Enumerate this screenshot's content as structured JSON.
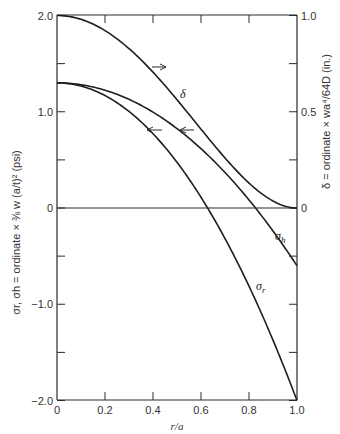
{
  "chart_data": {
    "type": "line",
    "title": "",
    "xlabel": "r/a",
    "ylabel_left": "σr, σh = ordinate × 3/8 w (a/t)² (psi)",
    "ylabel_right": "δ = ordinate × wa⁴/64D (in.)",
    "xlim": [
      0,
      1.0
    ],
    "ylim_left": [
      -2.0,
      2.0
    ],
    "ylim_right": [
      -2.0,
      1.0
    ],
    "x_ticks": [
      "0",
      "0.2",
      "0.4",
      "0.6",
      "0.8",
      "1.0"
    ],
    "y_ticks_left": [
      "2.0",
      "1.0",
      "0",
      "-1.0",
      "-2.0"
    ],
    "y_ticks_right": [
      "1.0",
      "0.5",
      "0"
    ],
    "grid": false,
    "x": [
      0,
      0.1,
      0.2,
      0.3,
      0.4,
      0.5,
      0.6,
      0.7,
      0.8,
      0.9,
      1.0
    ],
    "series": [
      {
        "name": "δ",
        "axis": "right",
        "label": "δ",
        "arrow": "right",
        "values": [
          1.0,
          0.98,
          0.922,
          0.828,
          0.706,
          0.5625,
          0.41,
          0.26,
          0.13,
          0.036,
          0.0
        ]
      },
      {
        "name": "σh",
        "axis": "left",
        "label": "σh",
        "arrow": "left",
        "values": [
          1.3,
          1.281,
          1.224,
          1.129,
          0.996,
          0.825,
          0.616,
          0.369,
          0.084,
          -0.239,
          -0.6
        ]
      },
      {
        "name": "σr",
        "axis": "left",
        "label": "σr",
        "arrow": "left",
        "values": [
          1.3,
          1.267,
          1.168,
          1.003,
          0.772,
          0.475,
          0.112,
          -0.317,
          -0.812,
          -1.373,
          -2.0
        ]
      }
    ]
  },
  "labels": {
    "xlabel": "r/a",
    "delta": "δ",
    "sigma_h": "σ",
    "sigma_h_sub": "h",
    "sigma_r": "σ",
    "sigma_r_sub": "r",
    "ylabel_left": "σr, σh = ordinate × ⅜ w (a/t)² (psi)",
    "ylabel_right": "δ = ordinate × wa⁴/64D (in.)"
  }
}
